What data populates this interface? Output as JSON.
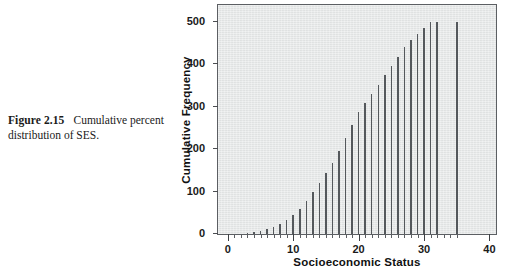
{
  "caption": {
    "figure_label": "Figure 2.15",
    "text": "Cumulative percent distribution of SES."
  },
  "chart_data": {
    "type": "bar",
    "title": "",
    "subtitle": "",
    "xlabel": "Socioeconomic Status",
    "ylabel": "Cumulative Frequency",
    "xlim": [
      -1.5,
      41
    ],
    "ylim": [
      0,
      540
    ],
    "grid": false,
    "legend": null,
    "style": "spike",
    "xticks": [
      0,
      10,
      20,
      30,
      40
    ],
    "xticklabels": [
      "0",
      "10",
      "20",
      "30",
      "40"
    ],
    "x_minor_tick_step": 1,
    "yticks": [
      0,
      100,
      200,
      300,
      400,
      500
    ],
    "yticklabels": [
      "0",
      "100",
      "200",
      "300",
      "400",
      "500"
    ],
    "x": [
      3,
      4,
      5,
      6,
      7,
      8,
      9,
      10,
      11,
      12,
      13,
      14,
      15,
      16,
      17,
      18,
      19,
      20,
      21,
      22,
      23,
      24,
      25,
      26,
      27,
      28,
      29,
      30,
      31,
      32,
      35
    ],
    "values": [
      2,
      4,
      7,
      11,
      16,
      24,
      33,
      45,
      60,
      78,
      98,
      120,
      143,
      168,
      196,
      226,
      256,
      287,
      309,
      330,
      352,
      374,
      396,
      418,
      440,
      458,
      472,
      486,
      499,
      500,
      500
    ]
  },
  "colors": {
    "plot_background": "#e6e8e8",
    "axis": "#5c5f63",
    "spike": "#54585c",
    "text": "#1a1a1a",
    "page_background": "#ffffff"
  }
}
